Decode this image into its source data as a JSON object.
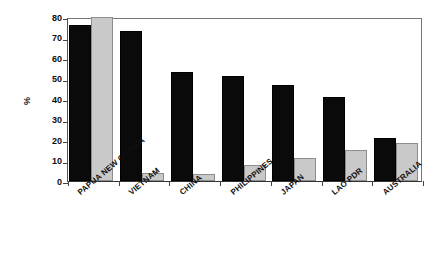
{
  "chart_data": {
    "type": "bar",
    "title": "",
    "subtitle": "",
    "xlabel": "",
    "ylabel": "%",
    "ylim": [
      0,
      80
    ],
    "yticks": [
      0,
      10,
      20,
      30,
      40,
      50,
      60,
      70,
      80
    ],
    "ytick_labels": [
      "0",
      "10",
      "20",
      "30",
      "40",
      "50",
      "60",
      "70",
      "80"
    ],
    "grid": false,
    "legend": null,
    "categories": [
      "PAPUA NEW GUINEA",
      "VIETNAM",
      "CHINA",
      "PHILIPPINES",
      "JAPAN",
      "LAO PDR",
      "AUSTRALIA"
    ],
    "series": [
      {
        "name": "series-a",
        "color": "#0a0a0a",
        "values": [
          76,
          73,
          53,
          51,
          47,
          41,
          21
        ]
      },
      {
        "name": "series-b",
        "color": "#c9c9c9",
        "values": [
          80,
          4,
          3.5,
          8,
          11,
          15,
          18.5
        ]
      }
    ]
  },
  "axis": {
    "y_label": "%"
  }
}
